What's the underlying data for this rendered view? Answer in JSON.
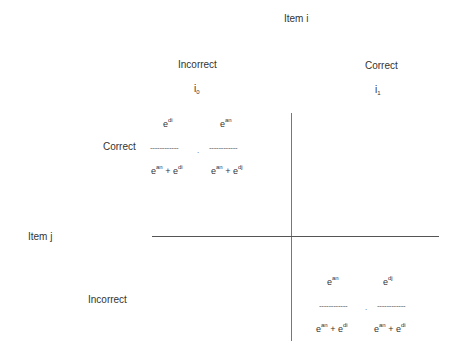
{
  "header": {
    "item_i": "Item i"
  },
  "columns": [
    {
      "label": "Incorrect",
      "symbol_base": "i",
      "symbol_sub": "0"
    },
    {
      "label": "Correct",
      "symbol_base": "i",
      "symbol_sub": "1"
    }
  ],
  "rows": [
    {
      "label": "Correct"
    },
    {
      "label": "Incorrect"
    }
  ],
  "item_j": "Item j",
  "cells": {
    "top_left": {
      "num1": {
        "base": "e",
        "exp": "di"
      },
      "num2": {
        "base": "e",
        "exp": "an"
      },
      "dash1": "------------",
      "dot": ".",
      "dash2": "------------",
      "den1": {
        "b1": "e",
        "e1": "an",
        "plus": " + ",
        "b2": "e",
        "e2": "di"
      },
      "den2": {
        "b1": "e",
        "e1": "an",
        "plus": " + ",
        "b2": "e",
        "e2": "dj"
      }
    },
    "bottom_right": {
      "num1": {
        "base": "e",
        "exp": "an"
      },
      "num2": {
        "base": "e",
        "exp": "dj"
      },
      "dash1": "------------",
      "dot": ".",
      "dash2": "------------",
      "den1": {
        "b1": "e",
        "e1": "an",
        "plus": " + ",
        "b2": "e",
        "e2": "di"
      },
      "den2": {
        "b1": "e",
        "e1": "an",
        "plus": " + ",
        "b2": "e",
        "e2": "di"
      }
    }
  }
}
